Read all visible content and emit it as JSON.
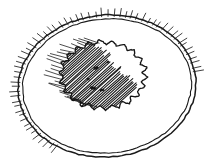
{
  "image": {
    "title": "Line drawing of a bread roll on a plate",
    "medium": "pen-and-ink sketch",
    "width": 210,
    "height": 167,
    "background_color": "#ffffff",
    "ink_color": "#1a1a1a"
  },
  "subjects": [
    {
      "name": "plate",
      "label": "Plate",
      "shape": "ellipse",
      "center_x": 107,
      "center_y": 86,
      "radius_x": 89,
      "radius_y": 71,
      "rotation_deg": -5,
      "rim_line_count": 2,
      "rim_hatch": {
        "present": true,
        "description": "short radiating tick marks along the lower-left rim",
        "start_angle_deg": 128,
        "end_angle_deg": 355,
        "tick_count": 60,
        "tick_length": 7
      }
    },
    {
      "name": "bread-roll",
      "label": "Bread roll",
      "shape": "wavy-blob",
      "center_x": 103,
      "center_y": 75,
      "radius_x": 42,
      "radius_y": 33,
      "outline_style": "scalloped wavy contour",
      "lobe_count": 22,
      "lobe_amplitude": 2.4,
      "shading": {
        "name": "shadow-hatching",
        "label": "Shadow hatching",
        "description": "dense parallel diagonal hatch lines filling the left and lower-left side of the roll, with looser strokes spilling out to the left",
        "hatch_angle_deg": -42,
        "line_count": 46,
        "spacing": 1.9
      },
      "surface_marks": {
        "name": "surface-specks",
        "label": "Surface specks",
        "count": 5,
        "description": "small irregular dark flecks on the lit right-hand face of the roll"
      }
    }
  ],
  "colors": {
    "ink": "#1a1a1a",
    "ink_light": "#3b3b3b",
    "paper": "#ffffff"
  }
}
